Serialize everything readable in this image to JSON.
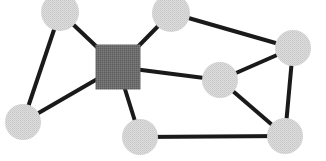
{
  "figure": {
    "type": "node-link-network-diagram",
    "title": "",
    "width": 326,
    "height": 161,
    "background_color": "#ffffff"
  },
  "style": {
    "edge_color": "#1a1a1a",
    "edge_width": 4,
    "circle_fill": "#d8d8d8",
    "circle_speckle": "#bdbdbd",
    "circle_radius": 18,
    "square_fill": "#6a6a6a",
    "square_speckle": "#5a5a5a",
    "square_size": 45
  },
  "chart_data": {
    "type": "scatter",
    "title": "",
    "xlabel": "",
    "ylabel": "",
    "xlim": [
      0,
      326
    ],
    "ylim": [
      0,
      161
    ],
    "grid": false,
    "legend": "none",
    "nodes": [
      {
        "id": "n1",
        "label": "",
        "shape": "circle",
        "x": 60,
        "y": 12,
        "r": 19,
        "color": "#d8d8d8",
        "degree": 2
      },
      {
        "id": "n2",
        "label": "",
        "shape": "circle",
        "x": 171,
        "y": 13,
        "r": 19,
        "color": "#d8d8d8",
        "degree": 2
      },
      {
        "id": "n3",
        "label": "",
        "shape": "circle",
        "x": 293,
        "y": 48,
        "r": 18,
        "color": "#d8d8d8",
        "degree": 3
      },
      {
        "id": "hub",
        "label": "",
        "shape": "square",
        "x": 118,
        "y": 67,
        "size": 45,
        "color": "#6a6a6a",
        "degree": 5
      },
      {
        "id": "n4",
        "label": "",
        "shape": "circle",
        "x": 220,
        "y": 80,
        "r": 18,
        "color": "#d8d8d8",
        "degree": 3
      },
      {
        "id": "n5",
        "label": "",
        "shape": "circle",
        "x": 23,
        "y": 122,
        "r": 18,
        "color": "#d8d8d8",
        "degree": 2
      },
      {
        "id": "n6",
        "label": "",
        "shape": "circle",
        "x": 140,
        "y": 137,
        "r": 18,
        "color": "#d8d8d8",
        "degree": 2
      },
      {
        "id": "n7",
        "label": "",
        "shape": "circle",
        "x": 285,
        "y": 136,
        "r": 18,
        "color": "#d8d8d8",
        "degree": 3
      }
    ],
    "edges": [
      {
        "source": "n1",
        "target": "n5",
        "weight": 1
      },
      {
        "source": "n1",
        "target": "hub",
        "weight": 1
      },
      {
        "source": "n5",
        "target": "hub",
        "weight": 1
      },
      {
        "source": "hub",
        "target": "n2",
        "weight": 1
      },
      {
        "source": "hub",
        "target": "n4",
        "weight": 1
      },
      {
        "source": "hub",
        "target": "n6",
        "weight": 1
      },
      {
        "source": "n2",
        "target": "n3",
        "weight": 1
      },
      {
        "source": "n3",
        "target": "n4",
        "weight": 1
      },
      {
        "source": "n3",
        "target": "n7",
        "weight": 1
      },
      {
        "source": "n4",
        "target": "n7",
        "weight": 1
      },
      {
        "source": "n6",
        "target": "n7",
        "weight": 1
      }
    ]
  }
}
